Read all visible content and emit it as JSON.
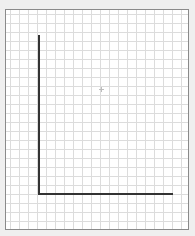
{
  "diagram": {
    "type": "blank-axes-on-grid-paper",
    "colors": {
      "background": "#efefef",
      "paper": "#ffffff",
      "grid": "#dcdcdc",
      "frame": "#8a8a8a",
      "axes": "#333333"
    },
    "grid_spacing_px": 9,
    "axes": {
      "y_axis": {
        "x": 39,
        "from_y": 35,
        "to_y": 194
      },
      "x_axis": {
        "y": 194,
        "from_x": 39,
        "to_x": 173
      }
    },
    "center_marker": {
      "x": 101,
      "y": 89
    }
  }
}
